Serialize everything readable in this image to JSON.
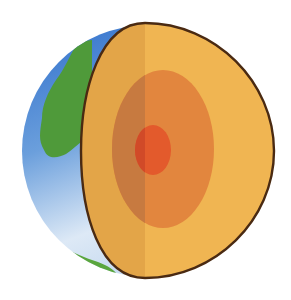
{
  "figure": {
    "subject": "Earth interior cross-section illustration",
    "layers": [
      {
        "name": "crust-mantle",
        "color": "#f0b552",
        "shade": "#e3a548"
      },
      {
        "name": "outer-core",
        "color": "#e2863e",
        "shade": "#c77a40"
      },
      {
        "name": "inner-core",
        "color": "#e35a2c",
        "shade": "#d14a28"
      }
    ],
    "surface": {
      "ocean_color": "#3f7fd0",
      "ocean_light": "#dce8f5",
      "land_color": "#4f9a3a",
      "outline_color": "#4a2a12"
    },
    "background": "#ffffff"
  }
}
